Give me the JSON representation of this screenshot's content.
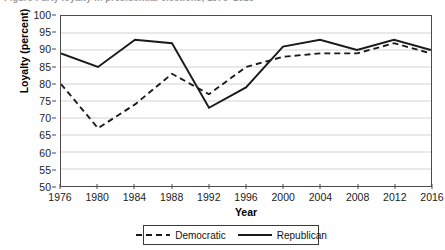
{
  "figure": {
    "title_remnant": "Figure   Party loyalty in presidential elections, 1976–2016"
  },
  "axes": {
    "x_title": "Year",
    "y_title": "Loyalty (percent)",
    "y_ticks": [
      50,
      55,
      60,
      65,
      70,
      75,
      80,
      85,
      90,
      95,
      100
    ],
    "x_ticks": [
      "1976",
      "1980",
      "1984",
      "1988",
      "1992",
      "1996",
      "2000",
      "2004",
      "2008",
      "2012",
      "2016"
    ]
  },
  "legend": {
    "entries": [
      {
        "label": "Democratic",
        "style": "dashed",
        "color": "#1a1a1a"
      },
      {
        "label": "Republican",
        "style": "solid",
        "color": "#1a1a1a"
      }
    ]
  },
  "chart_data": {
    "type": "line",
    "title": "Party loyalty in presidential elections, 1976–2016",
    "xlabel": "Year",
    "ylabel": "Loyalty (percent)",
    "x": [
      1976,
      1980,
      1984,
      1988,
      1992,
      1996,
      2000,
      2004,
      2008,
      2012,
      2016
    ],
    "categories": [
      "1976",
      "1980",
      "1984",
      "1988",
      "1992",
      "1996",
      "2000",
      "2004",
      "2008",
      "2012",
      "2016"
    ],
    "series": [
      {
        "name": "Democratic",
        "style": "dashed",
        "color": "#1a1a1a",
        "values": [
          80,
          67,
          74,
          83,
          77,
          85,
          88,
          89,
          89,
          92,
          89
        ]
      },
      {
        "name": "Republican",
        "style": "solid",
        "color": "#1a1a1a",
        "values": [
          89,
          85,
          93,
          92,
          73,
          79,
          91,
          93,
          90,
          93,
          90
        ]
      }
    ],
    "ylim": [
      50,
      100
    ],
    "ytick_step": 5,
    "xlim": [
      1976,
      2016
    ],
    "grid": "horizontal",
    "legend_position": "bottom"
  }
}
